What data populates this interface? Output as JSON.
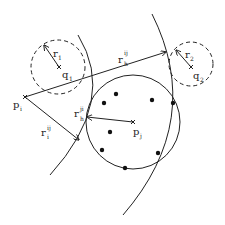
{
  "diagram": {
    "points": {
      "p_i": {
        "label": "p",
        "sub": "i",
        "x": 25,
        "y": 97
      },
      "p_j": {
        "label": "p",
        "sub": "j",
        "x": 133,
        "y": 122
      },
      "q_1": {
        "label": "q",
        "sub": "1",
        "x": 59,
        "y": 67
      },
      "q_2": {
        "label": "q",
        "sub": "2",
        "x": 191,
        "y": 67
      }
    },
    "radii_labels": {
      "r_1": {
        "label": "r",
        "sub": "1"
      },
      "r_2": {
        "label": "r",
        "sub": "2"
      },
      "r_h_ij": {
        "label": "r",
        "sub": "h",
        "sup": "ij"
      },
      "r_i_ij": {
        "label": "r",
        "sub": "i",
        "sup": "ij"
      },
      "r_h_ji": {
        "label": "r",
        "sub": "h",
        "sup": "ji"
      }
    },
    "dots": [
      {
        "x": 116,
        "y": 94
      },
      {
        "x": 104,
        "y": 103
      },
      {
        "x": 152,
        "y": 100
      },
      {
        "x": 173,
        "y": 103
      },
      {
        "x": 110,
        "y": 132
      },
      {
        "x": 102,
        "y": 150
      },
      {
        "x": 158,
        "y": 153
      },
      {
        "x": 125,
        "y": 168
      }
    ],
    "colors": {
      "stroke": "#222222",
      "background": "#ffffff"
    }
  }
}
